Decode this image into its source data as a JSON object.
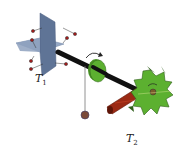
{
  "diagram": {
    "labels": {
      "t1": {
        "main": "T",
        "sub": "1"
      },
      "t2": {
        "main": "T",
        "sub": "2"
      }
    },
    "colors": {
      "plane": "#7f93b3",
      "plane_dark": "#566b8e",
      "shaft": "#111111",
      "disc": "#5cb030",
      "gear": "#5cb030",
      "gear_dark": "#2f5e1a",
      "pawl": "#9b2a14",
      "pendulum_bob": "#7a4a3a",
      "particle": "#a31b1b",
      "arrow": "#222222"
    }
  }
}
